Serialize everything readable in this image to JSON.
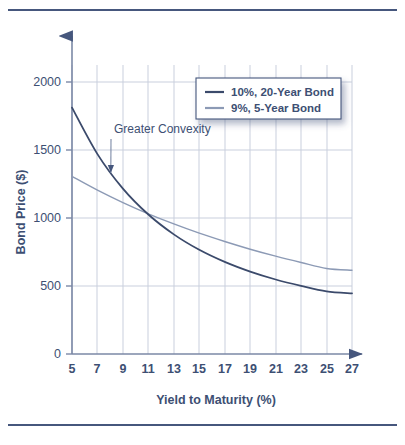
{
  "figure": {
    "background_color": "#ffffff",
    "rule_color": "#46577d",
    "axis_color": "#7b89a6",
    "grid_color": "#c9cfdd",
    "text_color": "#3d4f73"
  },
  "chart_data": {
    "type": "line",
    "title": "",
    "xlabel": "Yield to Maturity (%)",
    "ylabel": "Bond Price ($)",
    "xlim": [
      5,
      27
    ],
    "ylim": [
      0,
      2100
    ],
    "xticks": [
      5,
      7,
      9,
      11,
      13,
      15,
      17,
      19,
      21,
      23,
      25,
      27
    ],
    "xticklabels": [
      "5",
      "7",
      "9",
      "11",
      "13",
      "15",
      "17",
      "19",
      "21",
      "23",
      "25",
      "27"
    ],
    "yticks": [
      0,
      500,
      1000,
      1500,
      2000
    ],
    "yticklabels": [
      "0",
      "500",
      "1000",
      "1500",
      "2000"
    ],
    "grid": true,
    "grid_axes": "both",
    "legend_position": "upper right",
    "x": [
      5,
      7,
      9,
      11,
      13,
      15,
      17,
      19,
      21,
      23,
      25,
      27
    ],
    "series": [
      {
        "name": "10%, 20-Year Bond",
        "color": "#3b4a6b",
        "linewidth": 1.8,
        "values": [
          1627,
          1320,
          1092,
          921,
          790,
          688,
          608,
          544,
          492,
          450,
          414,
          400
        ]
      },
      {
        "name": "9%, 5-Year Bond",
        "color": "#8c9ab5",
        "linewidth": 1.4,
        "values": [
          1173,
          1082,
          1000,
          926,
          859,
          798,
          743,
          692,
          646,
          604,
          565,
          553
        ]
      }
    ],
    "annotations": [
      {
        "text": "Greater Convexity",
        "x": 8.3,
        "y": 1460,
        "arrow_to_x": 8.05,
        "arrow_to_y": 1195
      }
    ]
  },
  "legend": {
    "items": [
      {
        "label": "10%, 20-Year Bond",
        "color": "#3b4a6b"
      },
      {
        "label": "9%, 5-Year Bond",
        "color": "#8c9ab5"
      }
    ]
  }
}
